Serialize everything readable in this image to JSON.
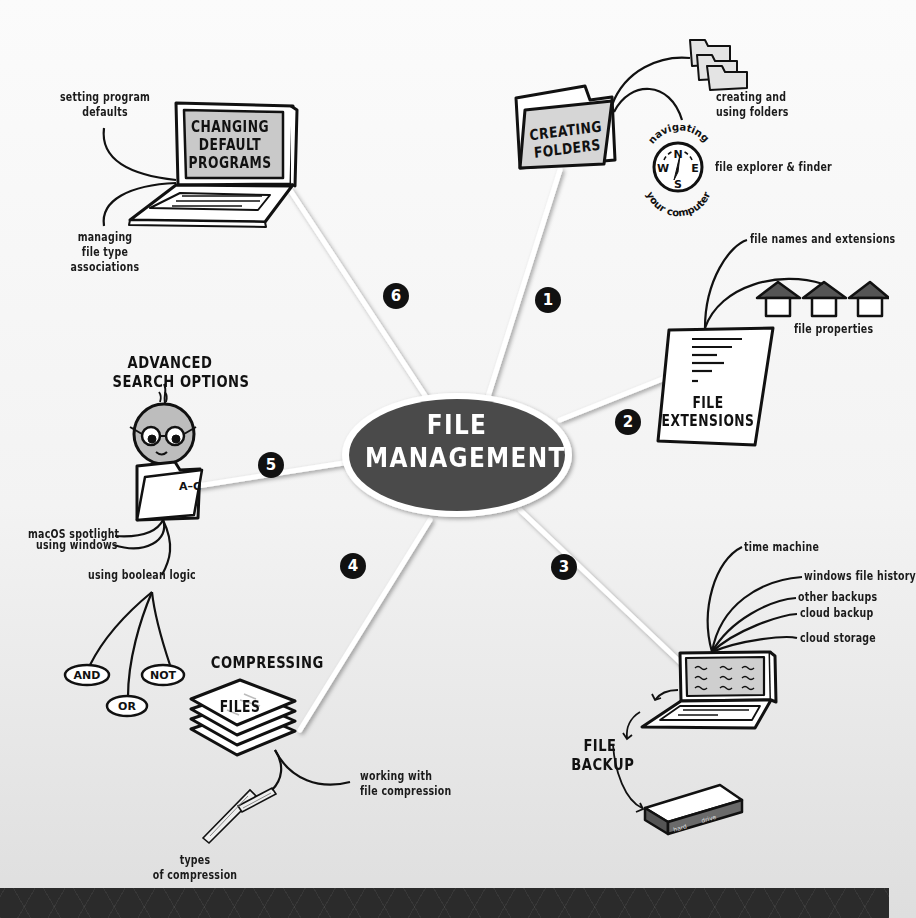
{
  "diagram": {
    "type": "mind-map",
    "center": {
      "line1": "FILE",
      "line2": "MANAGEMENT"
    },
    "colors": {
      "center_fill": "#4a4a4a",
      "center_ring": "#ffffff",
      "badge_fill": "#111111",
      "screen_gray": "#c8c8c8",
      "footer": "#2b2b2b"
    },
    "branches": [
      {
        "number": "1",
        "title_lines": [
          "CREATING",
          "FOLDERS"
        ],
        "subtopics": [
          "creating and using folders",
          "navigating your computer",
          "file explorer & finder"
        ]
      },
      {
        "number": "2",
        "title_lines": [
          "FILE",
          "EXTENSIONS"
        ],
        "subtopics": [
          "file names and extensions",
          "file properties"
        ]
      },
      {
        "number": "3",
        "title_lines": [
          "FILE",
          "BACKUP"
        ],
        "subtopics": [
          "time machine",
          "windows file history",
          "other backups",
          "cloud backup",
          "cloud storage"
        ],
        "device_labels": [
          "hard",
          "drive"
        ]
      },
      {
        "number": "4",
        "title_lines": [
          "COMPRESSING",
          "FILES"
        ],
        "subtopics": [
          "working with file compression",
          "types of compression"
        ]
      },
      {
        "number": "5",
        "title_lines": [
          "ADVANCED",
          "SEARCH OPTIONS"
        ],
        "folder_label": "A–C",
        "subtopics": [
          "macOS spotlight",
          "using windows",
          "using boolean logic"
        ],
        "boolean_ops": [
          "AND",
          "OR",
          "NOT"
        ]
      },
      {
        "number": "6",
        "title_lines": [
          "CHANGING",
          "DEFAULT",
          "PROGRAMS"
        ],
        "subtopics": [
          "setting program defaults",
          "managing file type associations"
        ]
      }
    ]
  },
  "labels": {
    "b1_creating_1": "creating and",
    "b1_creating_2": "using folders",
    "b1_nav_top": "navigating",
    "b1_nav_bottom": "your computer",
    "b1_explorer": "file explorer & finder",
    "compass": {
      "n": "N",
      "s": "S",
      "e": "E",
      "w": "W"
    },
    "b2_names": "file names and extensions",
    "b2_props": "file properties",
    "b3_time": "time machine",
    "b3_winhist": "windows file history",
    "b3_other": "other backups",
    "b3_cloudb": "cloud backup",
    "b3_clouds": "cloud storage",
    "b4_working_1": "working with",
    "b4_working_2": "file compression",
    "b4_types_1": "types",
    "b4_types_2": "of compression",
    "b5_spot": "macOS spotlight",
    "b5_win": "using windows",
    "b5_bool": "using boolean logic",
    "b6_setting_1": "setting program",
    "b6_setting_2": "defaults",
    "b6_managing_1": "managing",
    "b6_managing_2": "file type",
    "b6_managing_3": "associations"
  }
}
